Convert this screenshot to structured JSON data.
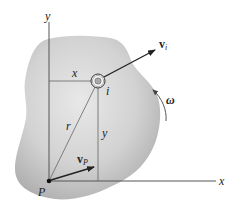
{
  "figure": {
    "colors": {
      "body_fill_light": "#e6e6e6",
      "body_fill_dark": "#b4b4b4",
      "axis": "#555555",
      "guide": "#666666",
      "arrow": "#222222",
      "text": "#222222"
    }
  },
  "axes": {
    "x_label": "x",
    "y_label": "y"
  },
  "points": {
    "origin_label": "P",
    "particle_label": "i"
  },
  "dimensions": {
    "horizontal_label": "x",
    "vertical_label": "y",
    "position_vector_label": "r"
  },
  "vectors": {
    "particle_velocity": {
      "main": "v",
      "sub": "i"
    },
    "point_velocity": {
      "main": "v",
      "sub": "P"
    }
  },
  "rotation": {
    "angular_velocity_label": "ω",
    "direction": "counterclockwise"
  }
}
